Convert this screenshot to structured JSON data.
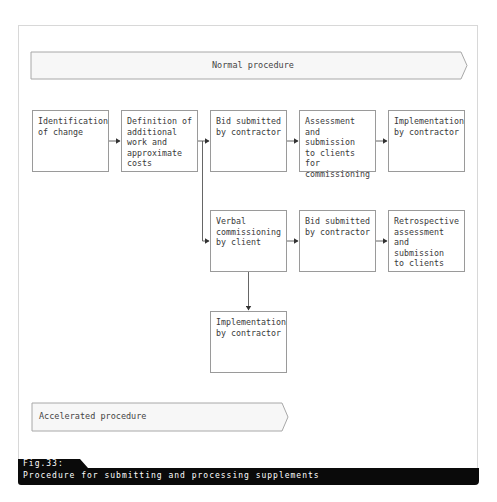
{
  "banners": {
    "normal": {
      "label": "Normal procedure"
    },
    "accelerated": {
      "label": "Accelerated procedure"
    }
  },
  "boxes": {
    "row1": [
      {
        "id": "identification",
        "text": "Identification\nof change"
      },
      {
        "id": "definition",
        "text": "Definition of\nadditional\nwork and\napproximate\ncosts"
      },
      {
        "id": "bid-normal",
        "text": "Bid submitted\nby contractor"
      },
      {
        "id": "assessment",
        "text": "Assessment\nand submission\nto clients for\ncommissioning"
      },
      {
        "id": "implementation-normal",
        "text": "Implementation\nby contractor"
      }
    ],
    "row2": [
      {
        "id": "verbal",
        "text": "Verbal\ncommissioning\nby client"
      },
      {
        "id": "bid-accelerated",
        "text": "Bid submitted\nby contractor"
      },
      {
        "id": "retrospective",
        "text": "Retrospective\nassessment\nand submission\nto clients"
      }
    ],
    "row3": [
      {
        "id": "implementation-accelerated",
        "text": "Implementation\nby contractor"
      }
    ]
  },
  "caption": {
    "figure": "Fig.33:",
    "text": "Procedure for submitting and processing supplements"
  },
  "colors": {
    "line": "#4a4a4a",
    "box_border": "#9a9a9a",
    "caption_bg": "#0a0a0a",
    "banner_fill": "#f7f7f7"
  }
}
